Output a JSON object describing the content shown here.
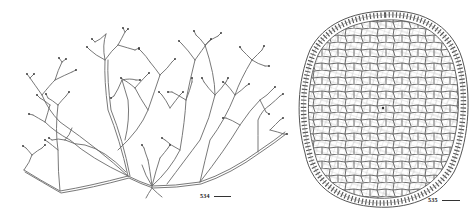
{
  "figures": [
    {
      "id": "534",
      "label": "534",
      "subject": "branched thallus habit illustration",
      "scale_bar": true
    },
    {
      "id": "535",
      "label": "535",
      "subject": "cross-section with polygonal cells and cortical layer",
      "scale_bar": true
    }
  ],
  "colors": {
    "line": "#555555",
    "background": "#ffffff"
  }
}
